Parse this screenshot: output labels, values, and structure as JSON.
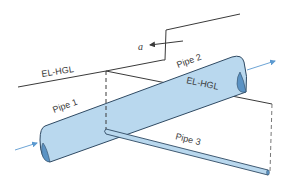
{
  "diagram": {
    "title": "",
    "labels": {
      "el_hgl_upper": "EL-HGL",
      "el_hgl_lower": "EL-HGL",
      "pipe1": "Pipe 1",
      "pipe2": "Pipe 2",
      "pipe3": "Pipe 3",
      "a": "a"
    },
    "colors": {
      "pipe_fill": "#b9d8ee",
      "pipe_outline": "#2f4a63",
      "pipe_end": "#5b93c4",
      "line": "#3a3a3a",
      "flow_arrow": "#5c9ad0"
    },
    "elements": [
      {
        "type": "pipe",
        "name": "Pipe 1",
        "description": "large pipe entering from lower-left"
      },
      {
        "type": "pipe",
        "name": "Pipe 2",
        "description": "continuation of large pipe exiting upper-right"
      },
      {
        "type": "pipe",
        "name": "Pipe 3",
        "description": "small branch pipe from junction to lower-right"
      },
      {
        "type": "line",
        "name": "EL-HGL",
        "description": "energy/hydraulic grade line rising along pipe 1 then jumping up at point a"
      },
      {
        "type": "line",
        "name": "EL-HGL",
        "description": "grade line descending along pipe 3"
      },
      {
        "type": "arrow",
        "name": "a",
        "description": "arrow pointing left at vertical step"
      },
      {
        "type": "arrow",
        "name": "flow-in",
        "description": "inflow arrow at left end of pipe 1"
      },
      {
        "type": "arrow",
        "name": "flow-out",
        "description": "outflow arrow at right end of pipe 2"
      }
    ]
  }
}
